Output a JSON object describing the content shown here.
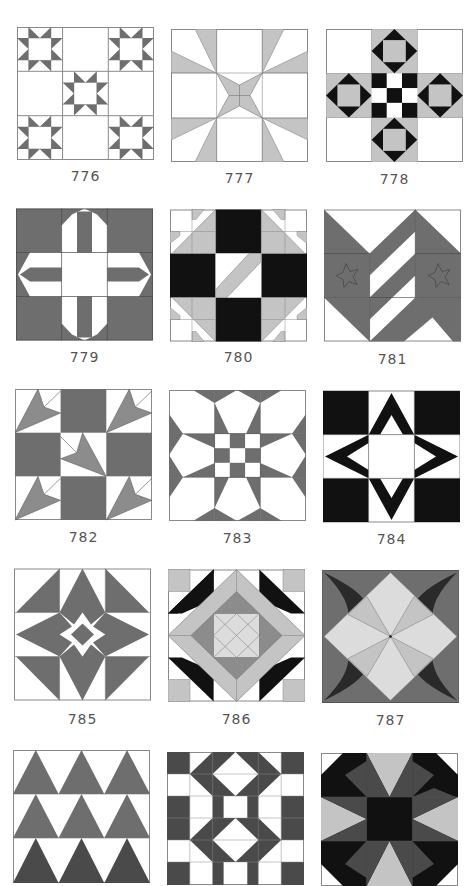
{
  "colors": {
    "white": "#ffffff",
    "outline": "#8a8a8a",
    "medium_gray": "#6e6e6e",
    "light_gray": "#c4c4c4",
    "pale_gray": "#dcdcdc",
    "dark_gray": "#4a4a4a",
    "black": "#111111"
  },
  "blocks": [
    {
      "number": "776",
      "style": "nine-patch with five sawtooth stars"
    },
    {
      "number": "777",
      "style": "radiating light wedges with central bowtie"
    },
    {
      "number": "778",
      "style": "cross of square-in-square diamonds with checkerboard center"
    },
    {
      "number": "779",
      "style": "striped cross on medium gray ground"
    },
    {
      "number": "780",
      "style": "black four-patch with light diagonals and corner star points"
    },
    {
      "number": "781",
      "style": "chevron stripes with appliqué stars"
    },
    {
      "number": "782",
      "style": "nine-patch with arrowhead/leaf triangles"
    },
    {
      "number": "783",
      "style": "eight-point star with checkerboard center"
    },
    {
      "number": "784",
      "style": "black four-point star outline on black corners"
    },
    {
      "number": "785",
      "style": "kite star with center diamond"
    },
    {
      "number": "786",
      "style": "nested diamond frames with corner squares and black triangles"
    },
    {
      "number": "787",
      "style": "curved-corner pinwheel diamond"
    },
    {
      "number": "788",
      "style": "rows of triangles"
    },
    {
      "number": "789",
      "style": "checkerboard with diamond-in-square motifs"
    },
    {
      "number": "790",
      "style": "octagonal star with light kites"
    }
  ]
}
